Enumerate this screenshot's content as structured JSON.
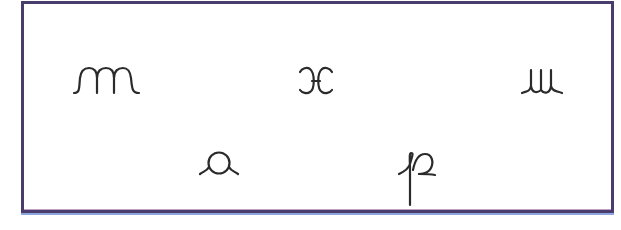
{
  "card": {
    "border_color": "#4b3c6e",
    "background": "#ffffff",
    "symbols": [
      {
        "id": "m",
        "name": "cursive m",
        "row": 1,
        "position": "left"
      },
      {
        "id": "x",
        "name": "cursive x",
        "row": 1,
        "position": "center"
      },
      {
        "id": "u",
        "name": "cursive u",
        "row": 1,
        "position": "right"
      },
      {
        "id": "a",
        "name": "cursive a",
        "row": 2,
        "position": "left-center"
      },
      {
        "id": "p",
        "name": "cursive p",
        "row": 2,
        "position": "right-center"
      }
    ]
  }
}
